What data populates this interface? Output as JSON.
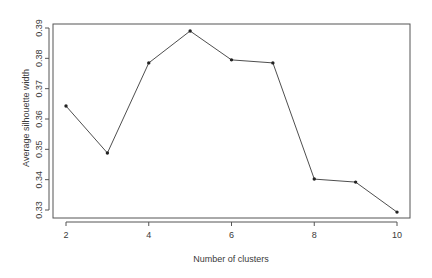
{
  "chart_data": {
    "type": "line",
    "title": "",
    "xlabel": "Number of clusters",
    "ylabel": "Average silhouette width",
    "x": [
      2,
      3,
      4,
      5,
      6,
      7,
      8,
      9,
      10
    ],
    "series": [
      {
        "name": "Average silhouette width",
        "values": [
          0.3643,
          0.3488,
          0.3785,
          0.389,
          0.3795,
          0.3785,
          0.3402,
          0.3392,
          0.3293
        ],
        "marker": "point",
        "color": "#3a3a3a"
      }
    ],
    "xticks": [
      2,
      4,
      6,
      8,
      10
    ],
    "xtick_labels": [
      "2",
      "4",
      "6",
      "8",
      "10"
    ],
    "yticks": [
      0.33,
      0.34,
      0.35,
      0.36,
      0.37,
      0.38,
      0.39
    ],
    "ytick_labels": [
      "0.33",
      "0.34",
      "0.35",
      "0.36",
      "0.37",
      "0.38",
      "0.39"
    ],
    "xlim": [
      1.68,
      10.32
    ],
    "ylim": [
      0.3274,
      0.3904
    ],
    "grid": false,
    "legend": null,
    "box": true
  }
}
